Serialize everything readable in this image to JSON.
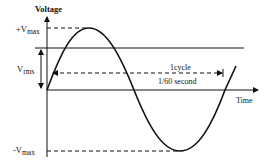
{
  "diagram": {
    "axis_y_label": "Voltage",
    "axis_x_label": "Time",
    "labels": {
      "vmax_pos_prefix": "+V",
      "vmax_pos_sub": "max",
      "vrms_prefix": "V",
      "vrms_sub": "rms",
      "vmax_neg_prefix": "-V",
      "vmax_neg_sub": "max",
      "cycle_line1": "1cycle",
      "cycle_line2": "1/60 second"
    },
    "colors": {
      "stroke": "#111111",
      "background": "#ffffff"
    }
  }
}
